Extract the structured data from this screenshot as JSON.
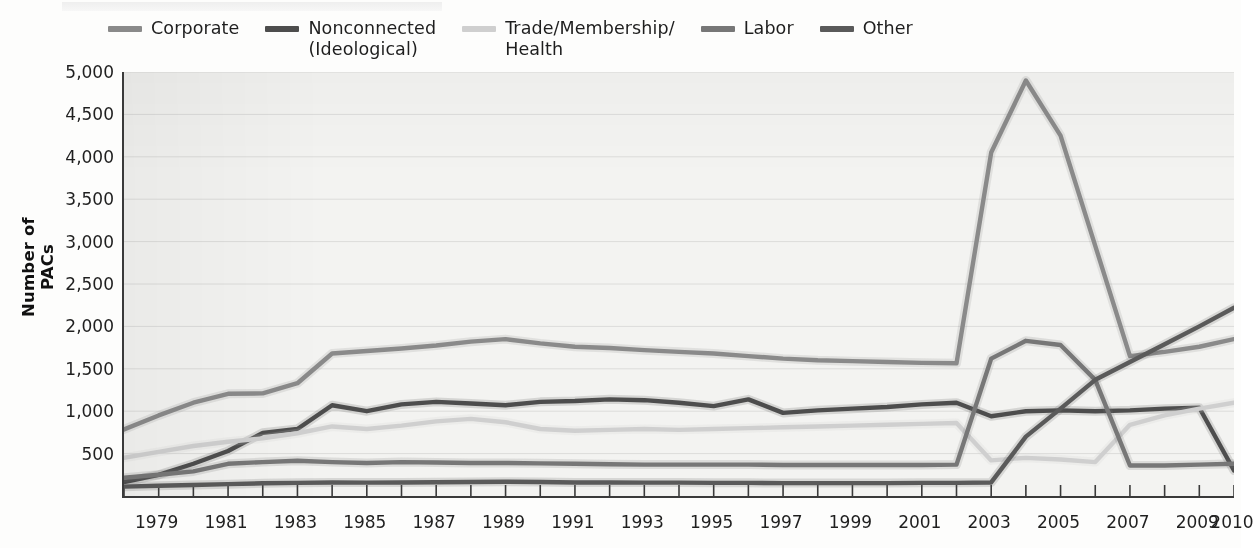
{
  "chart_data": {
    "type": "line",
    "title": "",
    "xlabel": "",
    "ylabel": "Number of PACs",
    "ylim": [
      0,
      5000
    ],
    "ytick_values": [
      500,
      1000,
      1500,
      2000,
      2500,
      3000,
      3500,
      4000,
      4500,
      5000
    ],
    "ytick_labels": [
      "500",
      "1,000",
      "1,500",
      "2,000",
      "2,500",
      "3,000",
      "3,500",
      "4,000",
      "4,500",
      "5,000"
    ],
    "xlim": [
      1978,
      2010
    ],
    "x": [
      1978,
      1979,
      1980,
      1981,
      1982,
      1983,
      1984,
      1985,
      1986,
      1987,
      1988,
      1989,
      1990,
      1991,
      1992,
      1993,
      1994,
      1995,
      1996,
      1997,
      1998,
      1999,
      2000,
      2001,
      2002,
      2003,
      2004,
      2005,
      2006,
      2007,
      2008,
      2009,
      2010
    ],
    "xtick_labels": [
      "1979",
      "1981",
      "1983",
      "1985",
      "1987",
      "1989",
      "1991",
      "1993",
      "1995",
      "1997",
      "1999",
      "2001",
      "2003",
      "2005",
      "2007",
      "2009",
      "2010"
    ],
    "xtick_values": [
      1979,
      1981,
      1983,
      1985,
      1987,
      1989,
      1991,
      1993,
      1995,
      1997,
      1999,
      2001,
      2003,
      2005,
      2007,
      2009,
      2010
    ],
    "grid": "horizontal",
    "legend_position": "top",
    "series": [
      {
        "name": "Corporate",
        "color": "#8a8a8a",
        "values": [
          785,
          950,
          1100,
          1205,
          1210,
          1330,
          1680,
          1710,
          1740,
          1775,
          1820,
          1850,
          1800,
          1760,
          1745,
          1720,
          1700,
          1680,
          1650,
          1620,
          1600,
          1590,
          1580,
          1570,
          1565,
          4050,
          4900,
          4250,
          2950,
          1650,
          1700,
          1760,
          1850
        ]
      },
      {
        "name": "Nonconnected\n(Ideological)",
        "color": "#4d4d4d",
        "values": [
          165,
          250,
          380,
          530,
          745,
          790,
          1070,
          1000,
          1080,
          1110,
          1090,
          1070,
          1110,
          1120,
          1140,
          1130,
          1100,
          1060,
          1140,
          980,
          1010,
          1030,
          1050,
          1080,
          1100,
          940,
          1000,
          1010,
          1000,
          1010,
          1030,
          1040,
          300
        ]
      },
      {
        "name": "Trade/Membership/\nHealth",
        "color": "#cfcfcf",
        "values": [
          450,
          520,
          590,
          640,
          680,
          740,
          820,
          790,
          830,
          880,
          910,
          870,
          790,
          770,
          780,
          790,
          780,
          790,
          800,
          810,
          820,
          830,
          840,
          850,
          860,
          420,
          450,
          430,
          400,
          840,
          950,
          1030,
          1100
        ]
      },
      {
        "name": "Labor",
        "color": "#777777",
        "values": [
          215,
          250,
          290,
          380,
          400,
          415,
          400,
          390,
          400,
          395,
          390,
          390,
          385,
          380,
          375,
          370,
          370,
          370,
          370,
          365,
          365,
          365,
          365,
          365,
          370,
          1620,
          1830,
          1780,
          1370,
          360,
          360,
          370,
          380
        ]
      },
      {
        "name": "Other",
        "color": "#5a5a5a",
        "values": [
          110,
          120,
          130,
          140,
          150,
          155,
          160,
          158,
          160,
          162,
          165,
          168,
          165,
          160,
          160,
          158,
          158,
          155,
          155,
          152,
          152,
          152,
          152,
          155,
          155,
          160,
          700,
          1030,
          1370,
          1580,
          1790,
          2000,
          2220
        ]
      }
    ]
  },
  "legend": {
    "items": [
      {
        "label": "Corporate",
        "color": "#8a8a8a"
      },
      {
        "label": "Nonconnected\n(Ideological)",
        "color": "#4d4d4d"
      },
      {
        "label": "Trade/Membership/\nHealth",
        "color": "#cfcfcf"
      },
      {
        "label": "Labor",
        "color": "#777777"
      },
      {
        "label": "Other",
        "color": "#5a5a5a"
      }
    ]
  },
  "axes": {
    "y_title": "Number of PACs"
  }
}
